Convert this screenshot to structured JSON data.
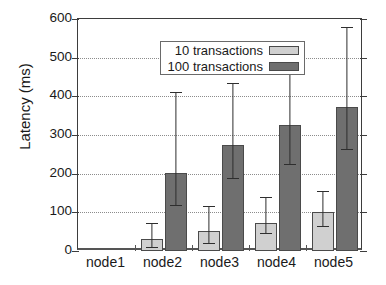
{
  "chart_data": {
    "type": "bar",
    "title": "",
    "xlabel": "",
    "ylabel": "Latency (ms)",
    "categories": [
      "node1",
      "node2",
      "node3",
      "node4",
      "node5"
    ],
    "ylim": [
      0,
      600
    ],
    "yticks": [
      0,
      100,
      200,
      300,
      400,
      500,
      600
    ],
    "grid": true,
    "legend_position": "upper-left-inside",
    "series": [
      {
        "name": "10 transactions",
        "color": "#d0d0d0",
        "values": [
          0,
          30,
          53,
          72,
          102
        ],
        "err_low": [
          0,
          7,
          18,
          44,
          62
        ],
        "err_high": [
          0,
          73,
          116,
          140,
          154
        ]
      },
      {
        "name": "100 transactions",
        "color": "#6f6f6f",
        "values": [
          0,
          203,
          275,
          327,
          373
        ],
        "err_low": [
          0,
          117,
          187,
          223,
          261
        ],
        "err_high": [
          0,
          410,
          434,
          500,
          580
        ]
      }
    ]
  },
  "axis": {
    "y_tick_labels": [
      "600",
      "500",
      "400",
      "300",
      "200",
      "100",
      "0"
    ]
  },
  "legend": {
    "entries": [
      {
        "label": "10 transactions",
        "swatch": "light-gray-swatch"
      },
      {
        "label": "100 transactions",
        "swatch": "dark-gray-swatch"
      }
    ]
  },
  "colors": {
    "series_10": "#d0d0d0",
    "series_100": "#6f6f6f",
    "axis": "#3d3d3d",
    "grid": "#8c8c8c",
    "text": "#1a1a1a",
    "background": "#ffffff"
  }
}
